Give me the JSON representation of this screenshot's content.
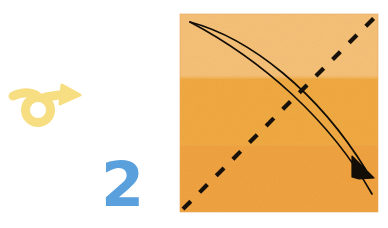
{
  "page": {
    "kind": "origami-instruction-diagram",
    "background_color": "#ffffff",
    "width": 388,
    "height": 228
  },
  "step": {
    "number": "2",
    "number_color": "#59a0dc",
    "number_position": {
      "x": 94,
      "y": 150
    }
  },
  "turn_over_symbol": {
    "name": "turn-over-loop-arrow",
    "label": "",
    "color": "#f7de82",
    "position": {
      "x": 8,
      "y": 78
    },
    "size": {
      "width": 72,
      "height": 56
    }
  },
  "paper": {
    "name": "origami-paper-square",
    "bounds": {
      "x": 180,
      "y": 14,
      "width": 198,
      "height": 198
    },
    "border_color": "#e3a055",
    "bands": [
      {
        "name": "band-top-light",
        "color": "#f6c178",
        "y_start": 14,
        "y_end": 78
      },
      {
        "name": "band-middle",
        "color": "#f1aa42",
        "y_start": 78,
        "y_end": 145
      },
      {
        "name": "band-bottom",
        "color": "#f0a340",
        "y_start": 145,
        "y_end": 212
      }
    ]
  },
  "annotations": {
    "crease_line": {
      "name": "valley-fold-dashed-diagonal",
      "style": "dashed",
      "color": "#151008",
      "from": {
        "x": 184,
        "y": 208
      },
      "to": {
        "x": 374,
        "y": 18
      },
      "dash_length": 11,
      "gap_length": 12,
      "stroke_width": 4
    },
    "fold_arrow": {
      "name": "fold-direction-curved-arrow",
      "style": "solid-double-curve",
      "color": "#100c06",
      "start": {
        "x": 190,
        "y": 22
      },
      "end": {
        "x": 368,
        "y": 172
      },
      "stroke_width": 1.6,
      "arrowhead": "solid-triangle"
    }
  },
  "colors": {
    "paper_light": "#f6c178",
    "paper_mid": "#f1aa42",
    "paper_deep": "#f0a340",
    "ink": "#120d07",
    "accent_blue": "#59a0dc",
    "accent_yellow": "#f7de82"
  }
}
